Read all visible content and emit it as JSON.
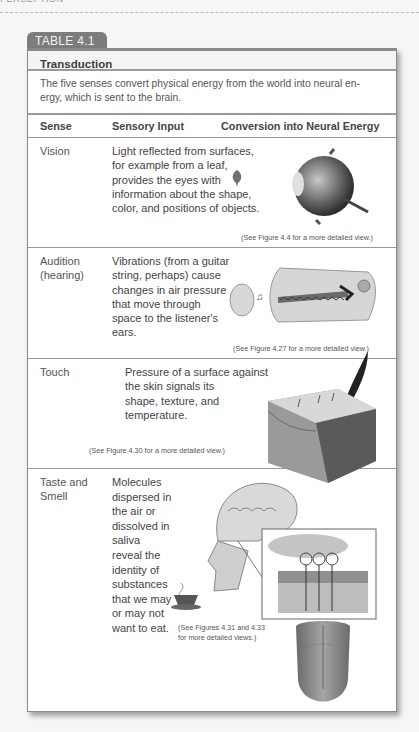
{
  "running_head": "PERCEPTION",
  "table": {
    "tab_label": "TABLE 4.1",
    "title": "Transduction",
    "intro": "The five senses convert physical energy from the world into neural en- ergy, which is sent to the brain.",
    "columns": [
      "Sense",
      "Sensory Input",
      "Conversion into Neural Energy"
    ],
    "rows": [
      {
        "sense": "Vision",
        "input_lines": [
          "Light reflected from surfaces,",
          "for example from a leaf,",
          "provides the eyes with",
          "information about the shape,",
          "color, and positions of objects."
        ],
        "caption": "(See Figure 4.4 for a more detailed view.)",
        "illustration": "eye-illustration"
      },
      {
        "sense_lines": [
          "Audition",
          "(hearing)"
        ],
        "input_lines": [
          "Vibrations (from a guitar",
          "string, perhaps) cause",
          "changes in air pressure",
          "that move through",
          "space to the listener's",
          "ears."
        ],
        "caption": "(See Figure 4.27 for a more detailed view.)",
        "illustration": "ear-illustration"
      },
      {
        "sense": "Touch",
        "input_lines": [
          "Pressure of a surface against",
          "the skin signals its",
          "shape, texture, and",
          "temperature."
        ],
        "caption": "(See Figure 4.30 for a more detailed view.)",
        "illustration": "skin-feather-illustration"
      },
      {
        "sense_lines": [
          "Taste and",
          "Smell"
        ],
        "input_lines": [
          "Molecules",
          "dispersed in",
          "the air or",
          "dissolved in",
          "saliva",
          "reveal the",
          "identity of",
          "substances",
          "that we may",
          "or may not",
          "want to eat."
        ],
        "caption_lines": [
          "(See Figures 4.31 and 4.33",
          "for more detailed views.)"
        ],
        "illustration": "head-olfactory-tongue-illustration"
      }
    ]
  },
  "colors": {
    "tab_bg": "#7c7c7c",
    "rule": "#9a9a9a",
    "text": "#444444",
    "page_bg": "#f6f6f4"
  }
}
